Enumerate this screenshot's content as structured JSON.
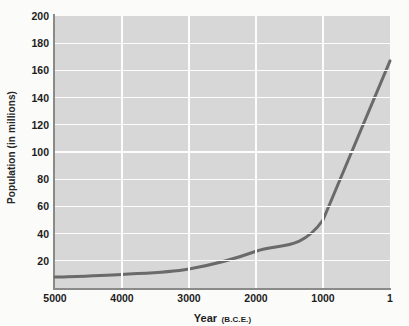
{
  "chart_data": {
    "type": "line",
    "title": "",
    "subtitle": "",
    "xlabel": "Year",
    "xlabel_suffix": "(B.C.E.)",
    "ylabel": "Population (in millions)",
    "x": [
      5000,
      4000,
      3000,
      2000,
      1000,
      1
    ],
    "values": [
      8,
      10,
      14,
      27,
      50,
      167
    ],
    "series": [
      {
        "name": "World population",
        "values": [
          8,
          10,
          14,
          27,
          50,
          167
        ]
      }
    ],
    "xtick_labels": [
      "5000",
      "4000",
      "3000",
      "2000",
      "1000",
      "1"
    ],
    "ytick_labels": [
      "20",
      "40",
      "60",
      "80",
      "100",
      "120",
      "140",
      "160",
      "180",
      "200"
    ],
    "ytick_values": [
      20,
      40,
      60,
      80,
      100,
      120,
      140,
      160,
      180,
      200
    ],
    "ylim": [
      0,
      200
    ],
    "xlim_reversed": true,
    "grid": true,
    "legend": "none",
    "line_color": "#6a6a6a",
    "plot_background": "#d7d7d7",
    "grid_color": "#fdfdfd",
    "axis_color": "#8a8a8a",
    "figure_background": "#fbfbfa",
    "annotations": []
  }
}
